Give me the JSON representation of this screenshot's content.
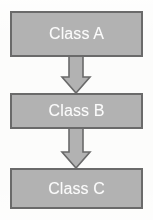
{
  "diagram": {
    "type": "flowchart-vertical",
    "background_color": "#fcfcfb",
    "nodes": [
      {
        "id": "class-a",
        "label": "Class A",
        "shape": "rectangle",
        "fill_color": "#b2b2b2",
        "border_color": "#6a6a6a",
        "text_color": "#fbfbfb"
      },
      {
        "id": "class-b",
        "label": "Class B",
        "shape": "rectangle",
        "fill_color": "#b2b2b2",
        "border_color": "#6a6a6a",
        "text_color": "#fbfbfb"
      },
      {
        "id": "class-c",
        "label": "Class C",
        "shape": "rectangle",
        "fill_color": "#b2b2b2",
        "border_color": "#6a6a6a",
        "text_color": "#fbfbfb"
      }
    ],
    "connectors": [
      {
        "id": "arrow-a-to-b",
        "from": "class-a",
        "to": "class-b",
        "direction": "down",
        "style": "block-arrow",
        "fill_color": "#b2b2b2",
        "border_color": "#6a6a6a"
      },
      {
        "id": "arrow-b-to-c",
        "from": "class-b",
        "to": "class-c",
        "direction": "down",
        "style": "block-arrow",
        "fill_color": "#b2b2b2",
        "border_color": "#6a6a6a"
      }
    ]
  }
}
